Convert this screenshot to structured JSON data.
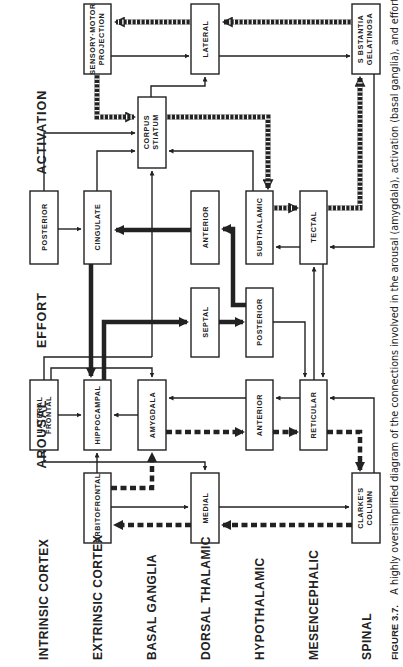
{
  "diagram": {
    "orientation": "rotated 90° counter-clockwise",
    "columns": [
      {
        "id": "activation",
        "label": "ACTIVATION"
      },
      {
        "id": "effort",
        "label": "EFFORT"
      },
      {
        "id": "arousal",
        "label": "AROUSAL"
      }
    ],
    "rows": [
      {
        "id": "intrinsic",
        "label": "INTRINSIC CORTEX"
      },
      {
        "id": "extrinsic",
        "label": "EXTRINSIC CORTEX"
      },
      {
        "id": "basal",
        "label": "BASAL GANGLIA"
      },
      {
        "id": "dorsal",
        "label": "DORSAL THALAMIC"
      },
      {
        "id": "hypothalamic",
        "label": "HYPOTHALAMIC"
      },
      {
        "id": "mesencephalic",
        "label": "MESENCEPHALIC"
      },
      {
        "id": "spinal",
        "label": "SPINAL"
      }
    ],
    "nodes": {
      "sensory_motor": {
        "line1": "SENSORY·MOTOR",
        "line2": "PROJECTION"
      },
      "lateral_thal": {
        "line1": "LATERAL",
        "line2": ""
      },
      "substantia": {
        "line1": "S BSTANTIA",
        "line2": "GELATINOSA"
      },
      "corpus": {
        "line1": "CORPUS",
        "line2": "STIATUM"
      },
      "posterior_cortex": {
        "line1": "POSTERIOR",
        "line2": ""
      },
      "cingulate": {
        "line1": "CINGULATE",
        "line2": ""
      },
      "anterior_thal": {
        "line1": "ANTERIOR",
        "line2": ""
      },
      "subthalamic": {
        "line1": "SUBTHALAMIC",
        "line2": ""
      },
      "tectal": {
        "line1": "TECTAL",
        "line2": ""
      },
      "septal": {
        "line1": "SEPTAL",
        "line2": ""
      },
      "posterior_hypo": {
        "line1": "POSTERIOR",
        "line2": ""
      },
      "lateral_frontal": {
        "line1": "LATERAL",
        "line2": "FRONTAL"
      },
      "hippocampal": {
        "line1": "HIPPOCAMPAL",
        "line2": ""
      },
      "amygdala": {
        "line1": "AMYGDALA",
        "line2": ""
      },
      "anterior_hypo": {
        "line1": "ANTERIOR",
        "line2": ""
      },
      "reticular": {
        "line1": "RETICULAR",
        "line2": ""
      },
      "orbitofrontal": {
        "line1": "ORBITOFRONTAL",
        "line2": ""
      },
      "medial": {
        "line1": "MEDIAL",
        "line2": ""
      },
      "clarkes": {
        "line1": "CLARKE'S",
        "line2": "COLUMN"
      }
    },
    "line_styles": {
      "thin": "thin solid arrow",
      "thick": "heavy solid arrow",
      "dashed": "heavy dashed arrow",
      "hatched": "hatched (striped) arrow"
    }
  },
  "caption": {
    "figure_label": "FIGURE 3.7.",
    "text": "A highly oversimplified diagram of the connections involved in the arousal (amygdala), activation (basal ganglia), and effort"
  }
}
